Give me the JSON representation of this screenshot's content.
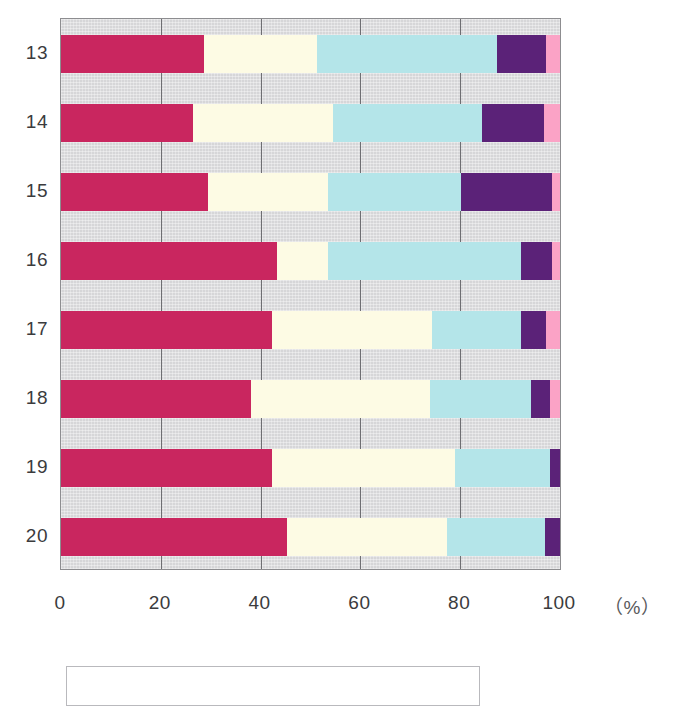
{
  "chart_data": {
    "type": "bar",
    "orientation": "horizontal",
    "stacked": true,
    "normalized": true,
    "title": "",
    "subtitle": "",
    "xlabel": "",
    "ylabel": "",
    "unit_label": "（%）",
    "xlim": [
      0,
      100
    ],
    "x_ticks": [
      0,
      20,
      40,
      60,
      80,
      100
    ],
    "x_tick_labels": [
      "0",
      "20",
      "40",
      "60",
      "80",
      "100"
    ],
    "grid": true,
    "grid_axis": "x",
    "legend_position": "bottom",
    "categories": [
      "13",
      "14",
      "15",
      "16",
      "17",
      "18",
      "19",
      "20"
    ],
    "series": [
      {
        "name": "series-1",
        "color": "#c9265f",
        "values": [
          28.7,
          26.5,
          29.5,
          43.3,
          42.3,
          38.1,
          42.3,
          45.3
        ]
      },
      {
        "name": "series-2",
        "color": "#fdfbe4",
        "values": [
          22.6,
          28.0,
          24.0,
          10.2,
          32.0,
          35.9,
          36.7,
          32.1
        ]
      },
      {
        "name": "series-3",
        "color": "#b4e5e9",
        "values": [
          36.0,
          29.9,
          26.7,
          38.7,
          17.8,
          20.2,
          18.9,
          19.6
        ]
      },
      {
        "name": "series-4",
        "color": "#5b2278",
        "values": [
          9.8,
          12.4,
          18.2,
          6.2,
          5.0,
          3.8,
          3.0,
          4.4
        ]
      },
      {
        "name": "series-5",
        "color": "#fba3c6",
        "values": [
          2.9,
          3.2,
          1.6,
          1.6,
          2.9,
          2.0,
          2.1,
          1.6
        ]
      }
    ]
  },
  "axis": {
    "y_labels": [
      "13",
      "14",
      "15",
      "16",
      "17",
      "18",
      "19",
      "20"
    ],
    "x_labels": [
      "0",
      "20",
      "40",
      "60",
      "80",
      "100"
    ],
    "unit": "（%）"
  },
  "colors": {
    "plot_background": "#d6d6d8",
    "gridline": "#6e6e72",
    "border": "#8d8d90",
    "text": "#3b3b3d",
    "legend_border": "#b9b9bd",
    "page_background": "#ffffff"
  }
}
